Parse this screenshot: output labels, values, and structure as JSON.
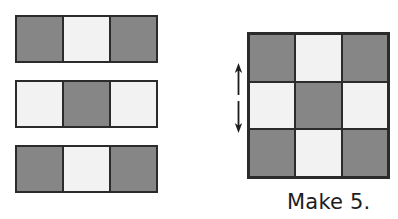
{
  "figure": {
    "caption": "Make 5.",
    "colors": {
      "dark_square": "#868686",
      "light_square": "#f2f2f2",
      "border": "#2b2b2b",
      "background": "#ffffff",
      "text": "#1d1d1d"
    }
  },
  "strips": {
    "label": "loose 1-by-3 strips",
    "items": [
      {
        "name": "strip-1",
        "pattern": [
          "dark",
          "light",
          "dark"
        ]
      },
      {
        "name": "strip-2",
        "pattern": [
          "light",
          "dark",
          "light"
        ]
      },
      {
        "name": "strip-3",
        "pattern": [
          "dark",
          "light",
          "dark"
        ]
      }
    ]
  },
  "grid": {
    "label": "3 by 3 checkerboard",
    "rows": 3,
    "cols": 3,
    "cells": [
      [
        "dark",
        "light",
        "dark"
      ],
      [
        "light",
        "dark",
        "light"
      ],
      [
        "dark",
        "light",
        "dark"
      ]
    ]
  },
  "arrow": {
    "name": "vertical-double-arrow",
    "direction": "up-down",
    "description": "broken double-headed arrow beside the middle row"
  },
  "icons": {
    "arrow_up": "arrow-up-icon",
    "arrow_down": "arrow-down-icon"
  }
}
